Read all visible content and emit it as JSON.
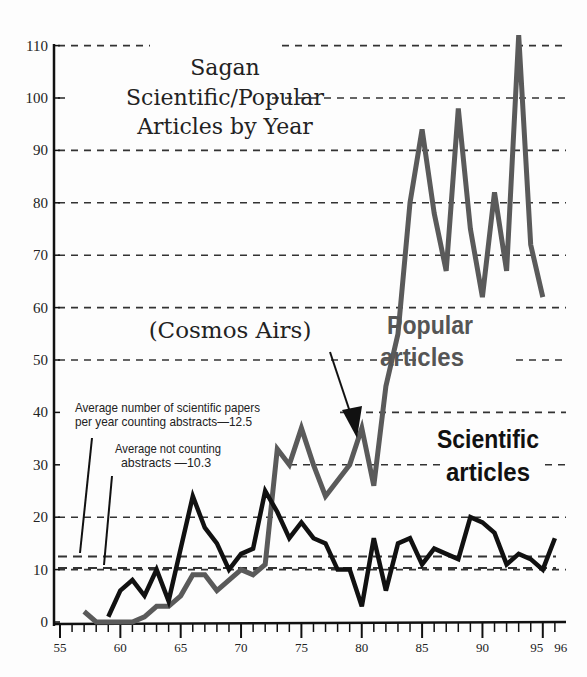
{
  "chart_data": {
    "type": "line",
    "title": "Sagan Scientific/Popular Articles by Year",
    "title_lines": [
      "Sagan",
      "Scientific/Popular",
      "Articles by Year"
    ],
    "xlabel": "",
    "ylabel": "",
    "xlim": [
      55,
      96
    ],
    "ylim": [
      0,
      110
    ],
    "x_ticks": [
      55,
      60,
      65,
      70,
      75,
      80,
      85,
      90,
      95,
      96
    ],
    "y_ticks": [
      0,
      10,
      20,
      30,
      40,
      50,
      60,
      70,
      80,
      90,
      100,
      110
    ],
    "grid": "dashed horizontal",
    "series": [
      {
        "name": "Popular articles",
        "color": "#5a5a5a",
        "x": [
          57,
          58,
          59,
          60,
          61,
          62,
          63,
          64,
          65,
          66,
          67,
          68,
          69,
          70,
          71,
          72,
          73,
          74,
          75,
          76,
          77,
          78,
          79,
          80,
          81,
          82,
          83,
          84,
          85,
          86,
          87,
          88,
          89,
          90,
          91,
          92,
          93,
          94,
          95
        ],
        "values": [
          2,
          0,
          0,
          0,
          0,
          1,
          3,
          3,
          5,
          9,
          9,
          6,
          8,
          10,
          9,
          11,
          33,
          30,
          37,
          30,
          24,
          27,
          30,
          37,
          26,
          45,
          55,
          80,
          94,
          78,
          67,
          98,
          75,
          62,
          82,
          67,
          112,
          72,
          62
        ]
      },
      {
        "name": "Scientific articles",
        "color": "#111111",
        "x": [
          59,
          60,
          61,
          62,
          63,
          64,
          65,
          66,
          67,
          68,
          69,
          70,
          71,
          72,
          73,
          74,
          75,
          76,
          77,
          78,
          79,
          80,
          81,
          82,
          83,
          84,
          85,
          86,
          87,
          88,
          89,
          90,
          91,
          92,
          93,
          94,
          95,
          96
        ],
        "values": [
          1,
          6,
          8,
          5,
          10,
          4,
          14,
          24,
          18,
          15,
          10,
          13,
          14,
          25,
          21,
          16,
          19,
          16,
          15,
          10,
          10,
          3,
          16,
          6,
          15,
          16,
          11,
          14,
          13,
          12,
          20,
          19,
          17,
          11,
          13,
          12,
          10,
          16
        ]
      }
    ],
    "reference_lines": [
      {
        "label": "Average number of scientific papers per year counting abstracts—12.5",
        "value": 12.5
      },
      {
        "label": "Average not counting abstracts—10.3",
        "value": 10.3
      }
    ],
    "annotations": [
      {
        "text": "(Cosmos Airs)",
        "points_to_year": 80
      }
    ]
  },
  "labels": {
    "title_1": "Sagan",
    "title_2": "Scientific/Popular",
    "title_3": "Articles by Year",
    "cosmos": "(Cosmos Airs)",
    "note1_line1": "Average number of scientific papers",
    "note1_line2": "per year counting abstracts—12.5",
    "note2_line1": "Average not counting",
    "note2_line2": "abstracts —10.3",
    "popular_1": "Popular",
    "popular_2": "articles",
    "scientific_1": "Scientific",
    "scientific_2": "articles"
  }
}
